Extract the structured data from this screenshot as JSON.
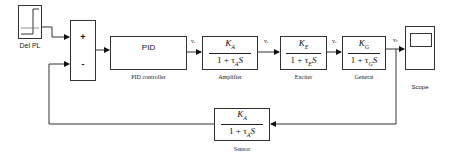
{
  "diagram": {
    "type": "block-diagram",
    "title": "",
    "blocks": {
      "step": {
        "caption": "Del PL"
      },
      "sum": {
        "plus": "+",
        "minus": "-"
      },
      "pid": {
        "text": "PID",
        "caption": "PID controller"
      },
      "amplifier": {
        "num_base": "K",
        "num_sub": "A",
        "den_pre": "1 + τ",
        "den_sub": "A",
        "den_post": "S",
        "caption": "Amplifier"
      },
      "exciter": {
        "num_base": "K",
        "num_sub": "E",
        "den_pre": "1 + τ",
        "den_sub": "E",
        "den_post": "S",
        "caption": "Exciter"
      },
      "generator": {
        "num_base": "K",
        "num_sub": "G",
        "den_pre": "1 + τ",
        "den_sub": "G",
        "den_post": "S",
        "caption": "Generat"
      },
      "scope": {
        "caption": "Scope"
      },
      "sensor": {
        "num_base": "K",
        "num_sub": "A",
        "den_pre": "1 + τ",
        "den_sub": "A",
        "den_post": "S",
        "caption": "Sensor"
      }
    },
    "signals": {
      "pid_out": "vₑ",
      "amp_out": "vₑ",
      "exc_out": "vₑ",
      "gen_out": "vₜ"
    },
    "colors": {
      "line": "#333333",
      "background": "#ffffff"
    }
  }
}
